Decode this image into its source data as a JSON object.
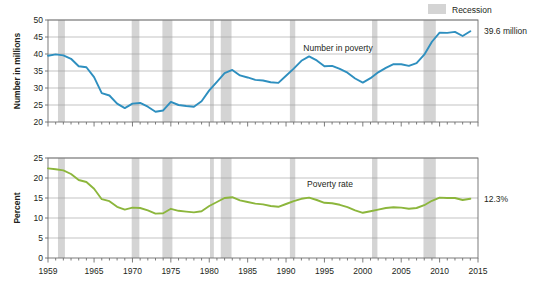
{
  "legend": {
    "recession_label": "Recession",
    "recession_color": "#d4d4d4"
  },
  "annotations": {
    "top_end_value": "39.6 million",
    "bottom_end_value": "12.3%"
  },
  "chart_data": [
    {
      "type": "line",
      "title": "",
      "series_label": "Number in poverty",
      "xlabel": "",
      "ylabel": "Number in millions",
      "color": "#2e8fbf",
      "xlim": [
        1959,
        2015
      ],
      "ylim": [
        20,
        50
      ],
      "yticks": [
        20,
        25,
        30,
        35,
        40,
        45,
        50
      ],
      "ytick_labels": [
        "20",
        "25",
        "30",
        "35",
        "40",
        "45",
        "50"
      ],
      "xticks": [
        1959,
        1965,
        1970,
        1975,
        1980,
        1985,
        1990,
        1995,
        2000,
        2005,
        2010,
        2015
      ],
      "xtick_labels": [
        "1959",
        "1965",
        "1970",
        "1975",
        "1980",
        "1985",
        "1990",
        "1995",
        "2000",
        "2005",
        "2010",
        "2015"
      ],
      "grid": true,
      "x": [
        1959,
        1960,
        1961,
        1962,
        1963,
        1964,
        1965,
        1966,
        1967,
        1968,
        1969,
        1970,
        1971,
        1972,
        1973,
        1974,
        1975,
        1976,
        1977,
        1978,
        1979,
        1980,
        1981,
        1982,
        1983,
        1984,
        1985,
        1986,
        1987,
        1988,
        1989,
        1990,
        1991,
        1992,
        1993,
        1994,
        1995,
        1996,
        1997,
        1998,
        1999,
        2000,
        2001,
        2002,
        2003,
        2004,
        2005,
        2006,
        2007,
        2008,
        2009,
        2010,
        2011,
        2012,
        2013,
        2014
      ],
      "values": [
        39.5,
        39.9,
        39.6,
        38.6,
        36.4,
        36.1,
        33.2,
        28.5,
        27.8,
        25.4,
        24.1,
        25.4,
        25.6,
        24.5,
        23.0,
        23.4,
        25.9,
        25.0,
        24.7,
        24.5,
        26.1,
        29.3,
        31.8,
        34.4,
        35.3,
        33.7,
        33.1,
        32.4,
        32.2,
        31.7,
        31.5,
        33.6,
        35.7,
        38.0,
        39.3,
        38.1,
        36.4,
        36.5,
        35.6,
        34.5,
        32.8,
        31.6,
        32.9,
        34.6,
        35.9,
        37.0,
        37.0,
        36.5,
        37.3,
        39.8,
        43.6,
        46.3,
        46.2,
        46.5,
        45.3,
        46.7
      ],
      "end_label": "39.6 million"
    },
    {
      "type": "line",
      "title": "",
      "series_label": "Poverty rate",
      "xlabel": "",
      "ylabel": "Percent",
      "color": "#8cb63c",
      "xlim": [
        1959,
        2015
      ],
      "ylim": [
        0,
        25
      ],
      "yticks": [
        0,
        5,
        10,
        15,
        20,
        25
      ],
      "ytick_labels": [
        "0",
        "5",
        "10",
        "15",
        "20",
        "25"
      ],
      "xticks": [
        1959,
        1965,
        1970,
        1975,
        1980,
        1985,
        1990,
        1995,
        2000,
        2005,
        2010,
        2015
      ],
      "xtick_labels": [
        "1959",
        "1965",
        "1970",
        "1975",
        "1980",
        "1985",
        "1990",
        "1995",
        "2000",
        "2005",
        "2010",
        "2015"
      ],
      "grid": true,
      "x": [
        1959,
        1960,
        1961,
        1962,
        1963,
        1964,
        1965,
        1966,
        1967,
        1968,
        1969,
        1970,
        1971,
        1972,
        1973,
        1974,
        1975,
        1976,
        1977,
        1978,
        1979,
        1980,
        1981,
        1982,
        1983,
        1984,
        1985,
        1986,
        1987,
        1988,
        1989,
        1990,
        1991,
        1992,
        1993,
        1994,
        1995,
        1996,
        1997,
        1998,
        1999,
        2000,
        2001,
        2002,
        2003,
        2004,
        2005,
        2006,
        2007,
        2008,
        2009,
        2010,
        2011,
        2012,
        2013,
        2014
      ],
      "values": [
        22.4,
        22.2,
        21.9,
        21.0,
        19.5,
        19.0,
        17.3,
        14.7,
        14.2,
        12.8,
        12.1,
        12.6,
        12.5,
        11.9,
        11.1,
        11.2,
        12.3,
        11.8,
        11.6,
        11.4,
        11.7,
        13.0,
        14.0,
        15.0,
        15.2,
        14.4,
        14.0,
        13.6,
        13.4,
        13.0,
        12.8,
        13.5,
        14.2,
        14.8,
        15.1,
        14.5,
        13.8,
        13.7,
        13.3,
        12.7,
        11.9,
        11.3,
        11.7,
        12.1,
        12.5,
        12.7,
        12.6,
        12.3,
        12.5,
        13.2,
        14.3,
        15.1,
        15.0,
        15.0,
        14.5,
        14.8
      ],
      "end_label": "12.3%"
    }
  ],
  "recessions": [
    {
      "start": 1960.3,
      "end": 1961.2
    },
    {
      "start": 1969.9,
      "end": 1970.9
    },
    {
      "start": 1973.9,
      "end": 1975.2
    },
    {
      "start": 1980.1,
      "end": 1980.6
    },
    {
      "start": 1981.5,
      "end": 1982.9
    },
    {
      "start": 1990.5,
      "end": 1991.2
    },
    {
      "start": 2001.2,
      "end": 2001.9
    },
    {
      "start": 2007.9,
      "end": 2009.5
    }
  ]
}
